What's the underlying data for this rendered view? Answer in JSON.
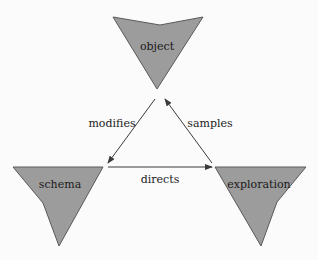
{
  "diagram": {
    "nodes": [
      {
        "id": "object",
        "label": "object"
      },
      {
        "id": "schema",
        "label": "schema"
      },
      {
        "id": "exploration",
        "label": "exploration"
      }
    ],
    "edges": [
      {
        "from": "object",
        "to": "schema",
        "label": "modifies"
      },
      {
        "from": "exploration",
        "to": "object",
        "label": "samples"
      },
      {
        "from": "schema",
        "to": "exploration",
        "label": "directs"
      }
    ],
    "colors": {
      "node_fill": "#9c9c9c",
      "node_stroke": "#5a5a5a",
      "edge": "#3a3a3a",
      "background": "#fbfbfb"
    }
  }
}
